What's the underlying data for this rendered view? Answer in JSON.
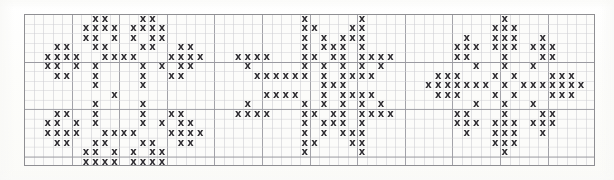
{
  "document": {
    "type": "cross-stitch-pattern-chart",
    "title": "Cross Stitch Snowflake Chart",
    "motif_count": 3,
    "symbol": "x",
    "symbol_name": "cross-stitch-x",
    "colors": {
      "background": "#fcfcfa",
      "page": "#ffffff",
      "stitch": "#2e2c31",
      "grid_minor": "#cfcfd4",
      "grid_major": "#9a9aa0",
      "border": "#8f8f93"
    }
  },
  "grid": {
    "origin_x": 24,
    "origin_y": 14,
    "cell": 9.52,
    "cols": 60,
    "rows": 16,
    "major_every": 5,
    "minor_width": 0.6,
    "major_width": 0.9
  },
  "motifs": [
    {
      "name": "motif-left-rosette",
      "label": "Rosette Snowflake",
      "col_offset": 1,
      "row_offset": 0,
      "width": 17,
      "height": 16,
      "cells": [
        [
          6,
          0
        ],
        [
          7,
          0
        ],
        [
          11,
          0
        ],
        [
          12,
          0
        ],
        [
          5,
          1
        ],
        [
          6,
          1
        ],
        [
          7,
          1
        ],
        [
          8,
          1
        ],
        [
          10,
          1
        ],
        [
          11,
          1
        ],
        [
          12,
          1
        ],
        [
          13,
          1
        ],
        [
          5,
          2
        ],
        [
          6,
          2
        ],
        [
          8,
          2
        ],
        [
          10,
          2
        ],
        [
          12,
          2
        ],
        [
          13,
          2
        ],
        [
          2,
          3
        ],
        [
          3,
          3
        ],
        [
          6,
          3
        ],
        [
          7,
          3
        ],
        [
          11,
          3
        ],
        [
          12,
          3
        ],
        [
          15,
          3
        ],
        [
          16,
          3
        ],
        [
          1,
          4
        ],
        [
          2,
          4
        ],
        [
          3,
          4
        ],
        [
          4,
          4
        ],
        [
          7,
          4
        ],
        [
          8,
          4
        ],
        [
          9,
          4
        ],
        [
          10,
          4
        ],
        [
          14,
          4
        ],
        [
          15,
          4
        ],
        [
          16,
          4
        ],
        [
          17,
          4
        ],
        [
          1,
          5
        ],
        [
          2,
          5
        ],
        [
          4,
          5
        ],
        [
          6,
          5
        ],
        [
          11,
          5
        ],
        [
          13,
          5
        ],
        [
          15,
          5
        ],
        [
          16,
          5
        ],
        [
          2,
          6
        ],
        [
          3,
          6
        ],
        [
          6,
          6
        ],
        [
          11,
          6
        ],
        [
          14,
          6
        ],
        [
          15,
          6
        ],
        [
          6,
          7
        ],
        [
          11,
          7
        ],
        [
          8,
          8
        ],
        [
          6,
          9
        ],
        [
          11,
          9
        ],
        [
          2,
          10
        ],
        [
          3,
          10
        ],
        [
          6,
          10
        ],
        [
          11,
          10
        ],
        [
          14,
          10
        ],
        [
          15,
          10
        ],
        [
          1,
          11
        ],
        [
          2,
          11
        ],
        [
          4,
          11
        ],
        [
          6,
          11
        ],
        [
          11,
          11
        ],
        [
          13,
          11
        ],
        [
          15,
          11
        ],
        [
          16,
          11
        ],
        [
          1,
          12
        ],
        [
          2,
          12
        ],
        [
          3,
          12
        ],
        [
          4,
          12
        ],
        [
          7,
          12
        ],
        [
          8,
          12
        ],
        [
          9,
          12
        ],
        [
          10,
          12
        ],
        [
          14,
          12
        ],
        [
          15,
          12
        ],
        [
          16,
          12
        ],
        [
          17,
          12
        ],
        [
          2,
          13
        ],
        [
          3,
          13
        ],
        [
          6,
          13
        ],
        [
          7,
          13
        ],
        [
          11,
          13
        ],
        [
          12,
          13
        ],
        [
          15,
          13
        ],
        [
          16,
          13
        ],
        [
          5,
          14
        ],
        [
          6,
          14
        ],
        [
          8,
          14
        ],
        [
          10,
          14
        ],
        [
          12,
          14
        ],
        [
          13,
          14
        ],
        [
          5,
          15
        ],
        [
          6,
          15
        ],
        [
          7,
          15
        ],
        [
          8,
          15
        ],
        [
          10,
          15
        ],
        [
          11,
          15
        ],
        [
          12,
          15
        ],
        [
          13,
          15
        ],
        [
          6,
          16
        ],
        [
          7,
          16
        ],
        [
          11,
          16
        ],
        [
          12,
          16
        ]
      ]
    },
    {
      "name": "motif-center-star",
      "label": "Eight Point Star",
      "col_offset": 21,
      "row_offset": 0,
      "width": 17,
      "height": 16,
      "cells": [
        [
          8,
          0
        ],
        [
          14,
          0
        ],
        [
          8,
          1
        ],
        [
          9,
          1
        ],
        [
          13,
          1
        ],
        [
          14,
          1
        ],
        [
          8,
          2
        ],
        [
          10,
          2
        ],
        [
          12,
          2
        ],
        [
          13,
          2
        ],
        [
          14,
          2
        ],
        [
          8,
          3
        ],
        [
          10,
          3
        ],
        [
          11,
          3
        ],
        [
          12,
          3
        ],
        [
          14,
          3
        ],
        [
          1,
          4
        ],
        [
          2,
          4
        ],
        [
          3,
          4
        ],
        [
          4,
          4
        ],
        [
          8,
          4
        ],
        [
          9,
          4
        ],
        [
          11,
          4
        ],
        [
          12,
          4
        ],
        [
          14,
          4
        ],
        [
          15,
          4
        ],
        [
          16,
          4
        ],
        [
          17,
          4
        ],
        [
          2,
          5
        ],
        [
          8,
          5
        ],
        [
          10,
          5
        ],
        [
          12,
          5
        ],
        [
          14,
          5
        ],
        [
          16,
          5
        ],
        [
          3,
          6
        ],
        [
          4,
          6
        ],
        [
          5,
          6
        ],
        [
          6,
          6
        ],
        [
          7,
          6
        ],
        [
          8,
          6
        ],
        [
          10,
          6
        ],
        [
          12,
          6
        ],
        [
          13,
          6
        ],
        [
          14,
          6
        ],
        [
          15,
          6
        ],
        [
          10,
          7
        ],
        [
          11,
          7
        ],
        [
          12,
          7
        ],
        [
          4,
          8
        ],
        [
          5,
          8
        ],
        [
          6,
          8
        ],
        [
          7,
          8
        ],
        [
          10,
          8
        ],
        [
          12,
          8
        ],
        [
          13,
          8
        ],
        [
          14,
          8
        ],
        [
          15,
          8
        ],
        [
          2,
          9
        ],
        [
          8,
          9
        ],
        [
          10,
          9
        ],
        [
          12,
          9
        ],
        [
          14,
          9
        ],
        [
          16,
          9
        ],
        [
          1,
          10
        ],
        [
          2,
          10
        ],
        [
          3,
          10
        ],
        [
          4,
          10
        ],
        [
          8,
          10
        ],
        [
          9,
          10
        ],
        [
          11,
          10
        ],
        [
          12,
          10
        ],
        [
          14,
          10
        ],
        [
          15,
          10
        ],
        [
          16,
          10
        ],
        [
          17,
          10
        ],
        [
          8,
          11
        ],
        [
          10,
          11
        ],
        [
          11,
          11
        ],
        [
          12,
          11
        ],
        [
          14,
          11
        ],
        [
          8,
          12
        ],
        [
          10,
          12
        ],
        [
          12,
          12
        ],
        [
          13,
          12
        ],
        [
          14,
          12
        ],
        [
          8,
          13
        ],
        [
          9,
          13
        ],
        [
          13,
          13
        ],
        [
          14,
          13
        ],
        [
          8,
          14
        ],
        [
          14,
          14
        ]
      ]
    },
    {
      "name": "motif-right-star",
      "label": "Diamond Snowflake",
      "col_offset": 42,
      "row_offset": 0,
      "width": 17,
      "height": 16,
      "cells": [
        [
          8,
          0
        ],
        [
          7,
          1
        ],
        [
          8,
          1
        ],
        [
          9,
          1
        ],
        [
          4,
          2
        ],
        [
          7,
          2
        ],
        [
          8,
          2
        ],
        [
          9,
          2
        ],
        [
          12,
          2
        ],
        [
          3,
          3
        ],
        [
          4,
          3
        ],
        [
          5,
          3
        ],
        [
          7,
          3
        ],
        [
          8,
          3
        ],
        [
          9,
          3
        ],
        [
          11,
          3
        ],
        [
          12,
          3
        ],
        [
          13,
          3
        ],
        [
          3,
          4
        ],
        [
          4,
          4
        ],
        [
          8,
          4
        ],
        [
          12,
          4
        ],
        [
          13,
          4
        ],
        [
          5,
          5
        ],
        [
          8,
          5
        ],
        [
          11,
          5
        ],
        [
          1,
          6
        ],
        [
          2,
          6
        ],
        [
          3,
          6
        ],
        [
          7,
          6
        ],
        [
          9,
          6
        ],
        [
          13,
          6
        ],
        [
          14,
          6
        ],
        [
          15,
          6
        ],
        [
          0,
          7
        ],
        [
          1,
          7
        ],
        [
          2,
          7
        ],
        [
          3,
          7
        ],
        [
          4,
          7
        ],
        [
          5,
          7
        ],
        [
          6,
          7
        ],
        [
          8,
          7
        ],
        [
          10,
          7
        ],
        [
          11,
          7
        ],
        [
          12,
          7
        ],
        [
          13,
          7
        ],
        [
          14,
          7
        ],
        [
          15,
          7
        ],
        [
          16,
          7
        ],
        [
          1,
          8
        ],
        [
          2,
          8
        ],
        [
          3,
          8
        ],
        [
          7,
          8
        ],
        [
          9,
          8
        ],
        [
          13,
          8
        ],
        [
          14,
          8
        ],
        [
          15,
          8
        ],
        [
          5,
          9
        ],
        [
          8,
          9
        ],
        [
          11,
          9
        ],
        [
          3,
          10
        ],
        [
          4,
          10
        ],
        [
          8,
          10
        ],
        [
          12,
          10
        ],
        [
          13,
          10
        ],
        [
          3,
          11
        ],
        [
          4,
          11
        ],
        [
          5,
          11
        ],
        [
          7,
          11
        ],
        [
          8,
          11
        ],
        [
          9,
          11
        ],
        [
          11,
          11
        ],
        [
          12,
          11
        ],
        [
          13,
          11
        ],
        [
          4,
          12
        ],
        [
          7,
          12
        ],
        [
          8,
          12
        ],
        [
          9,
          12
        ],
        [
          12,
          12
        ],
        [
          7,
          13
        ],
        [
          8,
          13
        ],
        [
          9,
          13
        ],
        [
          8,
          14
        ]
      ]
    }
  ]
}
